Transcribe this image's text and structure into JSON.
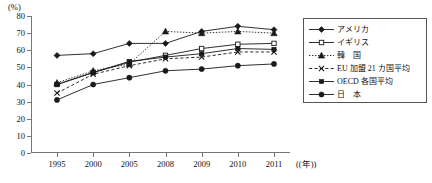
{
  "chart_data": {
    "type": "line",
    "title": "",
    "xlabel": "年",
    "ylabel": "(%)",
    "unit_y": "(%)",
    "unit_x": "(年)",
    "categories": [
      "1995",
      "2000",
      "2005",
      "2008",
      "2009",
      "2010",
      "2011"
    ],
    "x": [
      1995,
      2000,
      2005,
      2008,
      2009,
      2010,
      2011
    ],
    "ylim": [
      0,
      80
    ],
    "yticks": [
      0,
      10,
      20,
      30,
      40,
      50,
      60,
      70,
      80
    ],
    "ytick_labels": [
      "0",
      "10",
      "20",
      "30",
      "40",
      "50",
      "60",
      "70",
      "80"
    ],
    "grid": false,
    "legend_position": "right",
    "series": [
      {
        "name": "アメリカ",
        "marker": "diamond-filled",
        "dash": "solid",
        "values": [
          57,
          58,
          64,
          64,
          71,
          74,
          72
        ]
      },
      {
        "name": "イギリス",
        "marker": "square-open",
        "dash": "solid",
        "values": [
          40,
          47,
          53,
          57,
          61,
          63.5,
          64
        ]
      },
      {
        "name": "韓　国",
        "marker": "triangle-filled",
        "dash": "dotted",
        "values": [
          41,
          48,
          52,
          71,
          70,
          71,
          70
        ]
      },
      {
        "name": "EU 加盟 21 カ国平均",
        "marker": "x-cross",
        "dash": "dashed",
        "values": [
          35,
          46,
          51,
          55,
          56,
          59,
          59
        ]
      },
      {
        "name": "OECD 各国平均",
        "marker": "square-filled",
        "dash": "solid",
        "values": [
          40,
          47,
          53.5,
          56,
          58,
          61,
          60.5
        ]
      },
      {
        "name": "日　本",
        "marker": "circle-filled",
        "dash": "solid",
        "values": [
          31,
          40,
          44,
          48,
          49,
          51,
          52
        ]
      }
    ]
  },
  "legend": {
    "items": [
      {
        "label": "アメリカ"
      },
      {
        "label": "イギリス"
      },
      {
        "label": "韓　国"
      },
      {
        "label": "EU 加盟 21 カ国平均"
      },
      {
        "label": "OECD 各国平均"
      },
      {
        "label": "日　本"
      }
    ]
  },
  "colors": {
    "line": "#1a1a1a",
    "axis": "#777777",
    "text": "#111111",
    "background": "#ffffff"
  }
}
